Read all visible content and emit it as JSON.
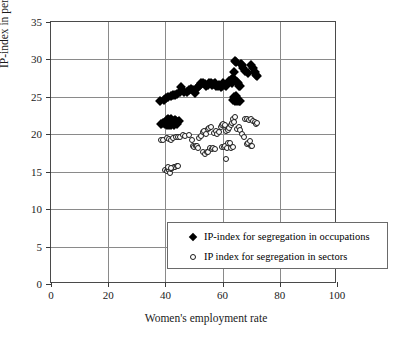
{
  "chart_data": {
    "type": "scatter",
    "title": "",
    "xlabel": "Women's employment rate",
    "ylabel": "IP-index in percent",
    "xlim": [
      0,
      100
    ],
    "ylim": [
      0,
      35
    ],
    "xticks": [
      0,
      20,
      40,
      60,
      80,
      100
    ],
    "yticks": [
      0,
      5,
      10,
      15,
      20,
      25,
      30,
      35
    ],
    "grid": true,
    "legend_position": "lower-right",
    "series": [
      {
        "name": "IP-index for segregation in occupations",
        "marker": "filled-diamond",
        "color": "#000000",
        "points": [
          [
            38.2,
            24.5
          ],
          [
            39.4,
            24.6
          ],
          [
            40.2,
            24.9
          ],
          [
            41.0,
            25.0
          ],
          [
            41.8,
            25.1
          ],
          [
            42.6,
            25.2
          ],
          [
            43.3,
            25.2
          ],
          [
            44.2,
            25.4
          ],
          [
            45.0,
            25.6
          ],
          [
            45.6,
            26.3
          ],
          [
            46.6,
            25.6
          ],
          [
            47.4,
            25.7
          ],
          [
            48.2,
            25.9
          ],
          [
            49.0,
            26.0
          ],
          [
            49.8,
            25.9
          ],
          [
            50.4,
            25.5
          ],
          [
            50.9,
            26.2
          ],
          [
            51.5,
            26.3
          ],
          [
            52.1,
            26.6
          ],
          [
            52.6,
            26.8
          ],
          [
            53.2,
            26.9
          ],
          [
            53.8,
            26.7
          ],
          [
            54.3,
            26.4
          ],
          [
            54.8,
            26.6
          ],
          [
            55.3,
            26.9
          ],
          [
            55.8,
            26.8
          ],
          [
            56.3,
            26.6
          ],
          [
            56.8,
            26.7
          ],
          [
            57.3,
            26.8
          ],
          [
            57.8,
            26.5
          ],
          [
            58.3,
            26.4
          ],
          [
            58.8,
            26.6
          ],
          [
            59.3,
            26.3
          ],
          [
            59.8,
            26.5
          ],
          [
            60.3,
            26.8
          ],
          [
            60.8,
            26.6
          ],
          [
            61.3,
            26.4
          ],
          [
            61.8,
            26.8
          ],
          [
            62.3,
            27.1
          ],
          [
            62.8,
            27.2
          ],
          [
            63.2,
            26.9
          ],
          [
            63.6,
            27.5
          ],
          [
            63.9,
            28.3
          ],
          [
            64.2,
            29.8
          ],
          [
            64.6,
            29.6
          ],
          [
            65.0,
            27.0
          ],
          [
            65.3,
            26.9
          ],
          [
            65.6,
            26.4
          ],
          [
            66.0,
            26.5
          ],
          [
            66.4,
            29.4
          ],
          [
            66.8,
            29.3
          ],
          [
            67.2,
            28.9
          ],
          [
            68.0,
            28.4
          ],
          [
            69.0,
            28.2
          ],
          [
            70.0,
            29.2
          ],
          [
            70.6,
            28.9
          ],
          [
            71.2,
            28.3
          ],
          [
            71.8,
            27.9
          ],
          [
            72.2,
            27.8
          ],
          [
            63.5,
            24.6
          ],
          [
            64.2,
            24.5
          ],
          [
            64.8,
            24.6
          ],
          [
            65.2,
            24.5
          ],
          [
            65.6,
            24.5
          ],
          [
            66.0,
            24.4
          ],
          [
            63.9,
            25.0
          ],
          [
            64.6,
            25.1
          ],
          [
            38.6,
            21.4
          ],
          [
            39.2,
            21.5
          ],
          [
            39.8,
            21.4
          ],
          [
            40.2,
            21.6
          ],
          [
            40.6,
            21.9
          ],
          [
            41.0,
            22.0
          ],
          [
            41.5,
            21.9
          ],
          [
            42.0,
            22.0
          ],
          [
            42.4,
            21.8
          ],
          [
            42.9,
            21.8
          ],
          [
            43.3,
            21.9
          ],
          [
            43.8,
            21.8
          ],
          [
            44.2,
            21.7
          ],
          [
            44.7,
            21.8
          ],
          [
            40.4,
            21.2
          ],
          [
            41.2,
            21.3
          ],
          [
            42.1,
            21.2
          ],
          [
            43.0,
            21.3
          ],
          [
            43.9,
            21.4
          ]
        ]
      },
      {
        "name": "IP index for segregation in sectors",
        "marker": "open-circle",
        "color": "#1a1a1a",
        "points": [
          [
            38.3,
            19.3
          ],
          [
            39.0,
            19.2
          ],
          [
            40.4,
            19.5
          ],
          [
            41.2,
            19.4
          ],
          [
            42.0,
            19.3
          ],
          [
            42.8,
            19.5
          ],
          [
            43.6,
            19.6
          ],
          [
            44.4,
            19.6
          ],
          [
            45.2,
            19.7
          ],
          [
            46.2,
            19.9
          ],
          [
            47.0,
            19.8
          ],
          [
            48.1,
            19.9
          ],
          [
            49.2,
            19.3
          ],
          [
            49.6,
            18.4
          ],
          [
            50.1,
            18.3
          ],
          [
            50.6,
            18.4
          ],
          [
            51.0,
            18.5
          ],
          [
            51.5,
            18.2
          ],
          [
            51.9,
            19.5
          ],
          [
            52.4,
            19.8
          ],
          [
            53.0,
            20.3
          ],
          [
            53.6,
            20.4
          ],
          [
            54.2,
            20.1
          ],
          [
            54.8,
            20.7
          ],
          [
            55.4,
            20.9
          ],
          [
            56.0,
            21.0
          ],
          [
            53.2,
            17.6
          ],
          [
            53.8,
            17.4
          ],
          [
            54.4,
            17.6
          ],
          [
            55.0,
            17.6
          ],
          [
            55.6,
            18.2
          ],
          [
            56.2,
            18.1
          ],
          [
            56.8,
            18.2
          ],
          [
            57.4,
            18.1
          ],
          [
            57.0,
            20.2
          ],
          [
            57.6,
            20.4
          ],
          [
            58.2,
            20.1
          ],
          [
            58.8,
            20.3
          ],
          [
            59.3,
            21.0
          ],
          [
            59.8,
            21.2
          ],
          [
            60.3,
            21.4
          ],
          [
            60.8,
            21.3
          ],
          [
            61.3,
            20.5
          ],
          [
            61.8,
            20.6
          ],
          [
            62.3,
            20.8
          ],
          [
            62.8,
            21.2
          ],
          [
            63.3,
            21.5
          ],
          [
            63.8,
            22.0
          ],
          [
            64.2,
            22.3
          ],
          [
            64.0,
            21.7
          ],
          [
            59.8,
            18.3
          ],
          [
            60.4,
            18.3
          ],
          [
            61.0,
            18.4
          ],
          [
            61.6,
            18.2
          ],
          [
            62.0,
            18.9
          ],
          [
            62.6,
            18.8
          ],
          [
            63.0,
            18.2
          ],
          [
            63.5,
            18.3
          ],
          [
            61.2,
            16.7
          ],
          [
            65.0,
            20.7
          ],
          [
            65.6,
            21.0
          ],
          [
            66.2,
            20.6
          ],
          [
            66.8,
            20.1
          ],
          [
            67.4,
            19.7
          ],
          [
            68.0,
            22.0
          ],
          [
            68.6,
            22.1
          ],
          [
            69.2,
            21.9
          ],
          [
            70.0,
            22.0
          ],
          [
            70.6,
            21.8
          ],
          [
            71.2,
            21.6
          ],
          [
            71.8,
            21.4
          ],
          [
            72.2,
            21.5
          ],
          [
            68.4,
            18.7
          ],
          [
            69.0,
            18.9
          ],
          [
            69.6,
            19.1
          ],
          [
            70.0,
            18.5
          ],
          [
            70.4,
            18.4
          ],
          [
            40.0,
            15.2
          ],
          [
            40.4,
            15.1
          ],
          [
            40.8,
            15.3
          ],
          [
            41.2,
            15.2
          ],
          [
            41.6,
            14.8
          ],
          [
            42.0,
            15.4
          ],
          [
            42.4,
            15.5
          ],
          [
            42.9,
            15.6
          ],
          [
            43.4,
            15.6
          ],
          [
            43.9,
            15.7
          ],
          [
            44.4,
            15.8
          ],
          [
            41.0,
            15.6
          ],
          [
            41.8,
            15.5
          ]
        ]
      }
    ]
  },
  "legend": {
    "items": [
      {
        "label": "IP-index for segregation in occupations",
        "marker": "filled-diamond"
      },
      {
        "label": "IP index for segregation in sectors",
        "marker": "open-circle"
      }
    ]
  },
  "axes": {
    "x_title": "Women's employment rate",
    "y_title": "IP-index in percent",
    "x_tick_labels": [
      "0",
      "20",
      "40",
      "60",
      "80",
      "100"
    ],
    "y_tick_labels": [
      "0",
      "5",
      "10",
      "15",
      "20",
      "25",
      "30",
      "35"
    ]
  }
}
